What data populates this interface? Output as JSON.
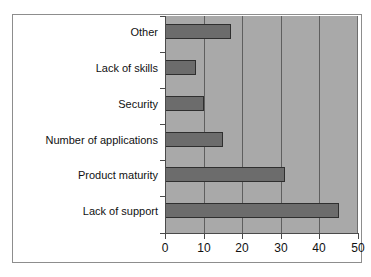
{
  "chart_data": {
    "type": "bar",
    "orientation": "horizontal",
    "title": "",
    "subtitle": "",
    "xlabel": "",
    "ylabel": "",
    "categories": [
      "Lack of support",
      "Product maturity",
      "Number of applications",
      "Security",
      "Lack of skills",
      "Other"
    ],
    "values": [
      45,
      31,
      15,
      10,
      8,
      17
    ],
    "series": [
      {
        "name": "",
        "values": [
          45,
          31,
          15,
          10,
          8,
          17
        ]
      }
    ],
    "xlim": [
      0,
      50
    ],
    "xticks": [
      0,
      10,
      20,
      30,
      40,
      50
    ],
    "xtick_labels": [
      "0",
      "10",
      "20",
      "30",
      "40",
      "50"
    ],
    "grid": true,
    "grid_axis": "x",
    "legend": false,
    "legend_position": "none",
    "colors": {
      "bar_fill": "#6c6c6c",
      "bar_border": "#2f2f2f",
      "plot_background": "#a9a9a9",
      "gridline": "#5f5f5f",
      "axis": "#4a4a4a",
      "figure_background": "#ffffff",
      "frame_border": "#8d8d8d",
      "text": "#111111"
    },
    "bars": [
      {
        "label": "Other",
        "value": 17,
        "row": 0
      },
      {
        "label": "Lack of skills",
        "value": 8,
        "row": 1
      },
      {
        "label": "Security",
        "value": 10,
        "row": 2
      },
      {
        "label": "Number of applications",
        "value": 15,
        "row": 3
      },
      {
        "label": "Product maturity",
        "value": 31,
        "row": 4
      },
      {
        "label": "Lack of support",
        "value": 45,
        "row": 5
      }
    ]
  }
}
